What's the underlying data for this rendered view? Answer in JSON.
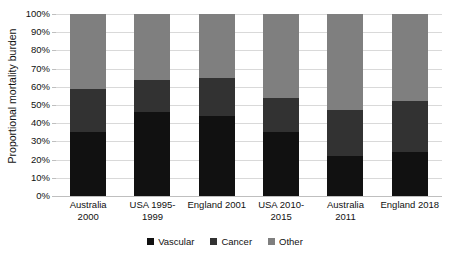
{
  "chart_data": {
    "type": "bar",
    "subtype": "stacked-bar-100-percent",
    "title": "",
    "xlabel": "",
    "ylabel": "Proportional mortality burden",
    "categories": [
      "Australia 2000",
      "USA 1995-1999",
      "England 2001",
      "USA 2010-2015",
      "Australia 2011",
      "England 2018"
    ],
    "category_lines": [
      [
        "Australia",
        "2000"
      ],
      [
        "USA 1995-",
        "1999"
      ],
      [
        "England 2001",
        ""
      ],
      [
        "USA 2010-",
        "2015"
      ],
      [
        "Australia",
        "2011"
      ],
      [
        "England 2018",
        ""
      ]
    ],
    "series": [
      {
        "name": "Vascular",
        "color": "#111111",
        "values": [
          35,
          46,
          44,
          35,
          22,
          24
        ]
      },
      {
        "name": "Cancer",
        "color": "#323232",
        "values": [
          24,
          18,
          21,
          19,
          25,
          28
        ]
      },
      {
        "name": "Other",
        "color": "#7f7f7f",
        "values": [
          41,
          36,
          35,
          46,
          53,
          48
        ]
      }
    ],
    "ylim": [
      0,
      100
    ],
    "ytick_values": [
      0,
      10,
      20,
      30,
      40,
      50,
      60,
      70,
      80,
      90,
      100
    ],
    "ytick_labels": [
      "0%",
      "10%",
      "20%",
      "30%",
      "40%",
      "50%",
      "60%",
      "70%",
      "80%",
      "90%",
      "100%"
    ],
    "grid": true,
    "legend_position": "bottom",
    "legend": [
      {
        "label": "Vascular",
        "color": "#111111"
      },
      {
        "label": "Cancer",
        "color": "#323232"
      },
      {
        "label": "Other",
        "color": "#7f7f7f"
      }
    ],
    "background_color": "#ffffff",
    "gridline_color": "#d9d9d9"
  }
}
